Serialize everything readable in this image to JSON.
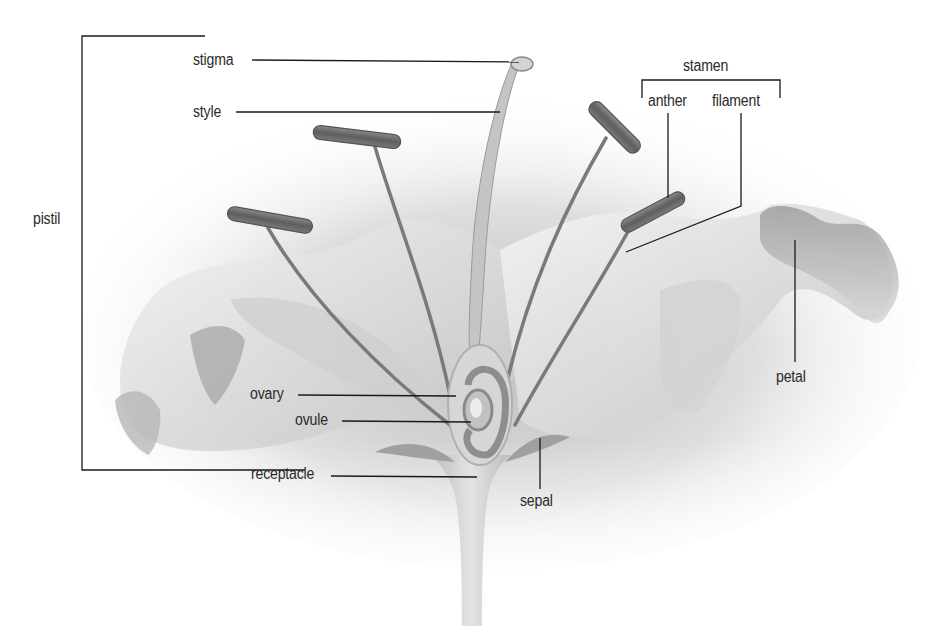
{
  "diagram": {
    "labels": {
      "pistil": "pistil",
      "stigma": "stigma",
      "style": "style",
      "stamen": "stamen",
      "anther": "anther",
      "filament": "filament",
      "petal": "petal",
      "ovary": "ovary",
      "ovule": "ovule",
      "receptacle": "receptacle",
      "sepal": "sepal"
    },
    "groups": {
      "pistil": [
        "stigma",
        "style",
        "ovary",
        "ovule"
      ],
      "stamen": [
        "anther",
        "filament"
      ]
    },
    "colors": {
      "line": "#1a1a1a",
      "text": "#2a2a2a",
      "petal_light": "#e8e8e8",
      "petal_dark": "#9a9a9a",
      "anther": "#6e6e6e",
      "stem": "#d0d0d0"
    }
  }
}
